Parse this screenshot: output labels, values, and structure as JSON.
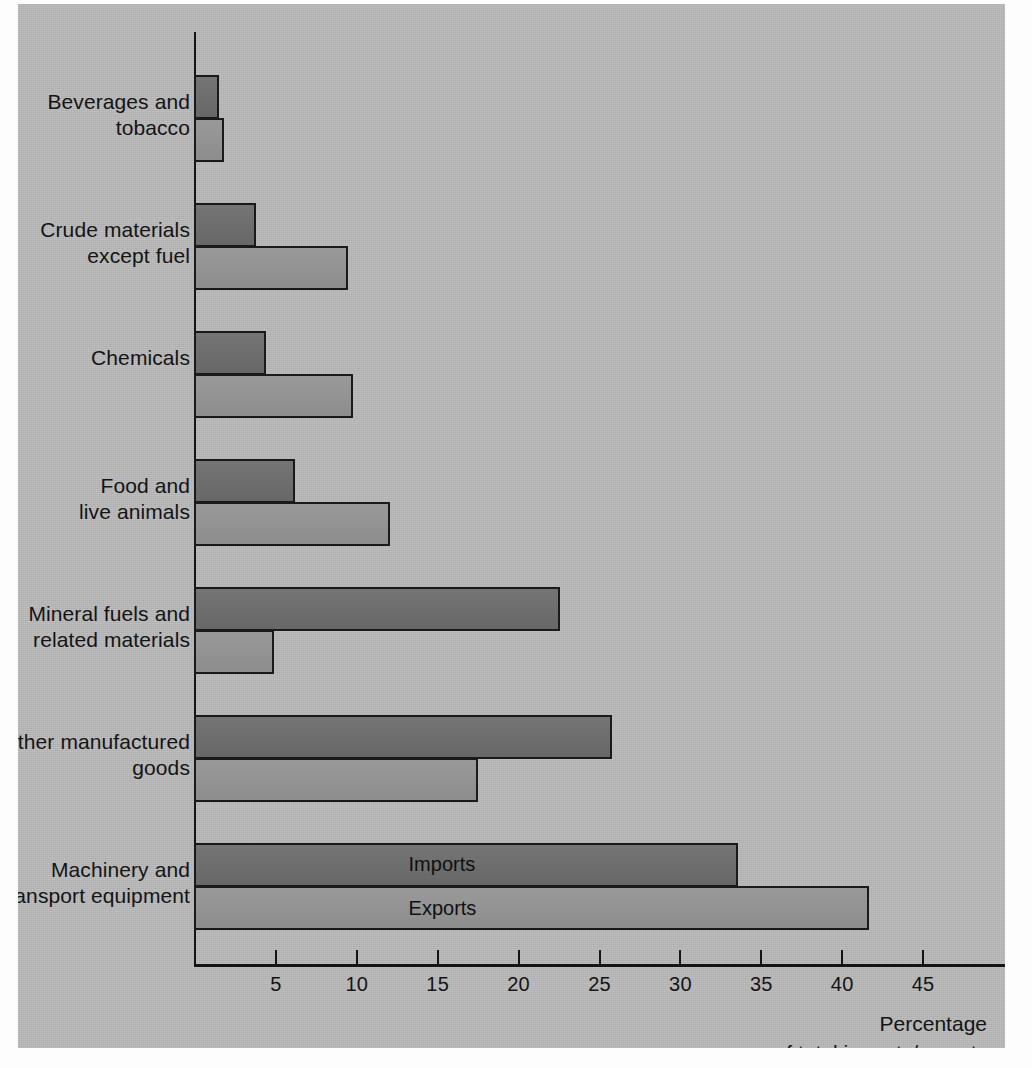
{
  "chart_data": {
    "type": "bar",
    "orientation": "horizontal",
    "title": "",
    "subtitle": "",
    "xlabel": "Percentage of total imports/exports",
    "ylabel": "",
    "xlim": [
      0,
      49
    ],
    "xticks": [
      5,
      10,
      15,
      20,
      25,
      30,
      35,
      40,
      45
    ],
    "xtick_labels": [
      "5",
      "10",
      "15",
      "20",
      "25",
      "30",
      "35",
      "40",
      "45"
    ],
    "grid": false,
    "legend_position": "in-bar",
    "categories": [
      "Beverages and\ntobacco",
      "Crude materials\nexcept fuel",
      "Chemicals",
      "Food and\nlive animals",
      "Mineral fuels and\nrelated materials",
      "Other manufactured\ngoods",
      "Machinery and\ntransport equipment"
    ],
    "series": [
      {
        "name": "Imports",
        "color": "#6d6d6d",
        "values": [
          1.4,
          3.7,
          4.3,
          6.1,
          22.5,
          25.7,
          33.5
        ]
      },
      {
        "name": "Exports",
        "color": "#949494",
        "values": [
          1.7,
          9.4,
          9.7,
          12.0,
          4.8,
          17.4,
          41.6
        ]
      }
    ],
    "annotations": [
      {
        "text": "Imports",
        "category": "Machinery and\ntransport equipment",
        "series": "Imports"
      },
      {
        "text": "Exports",
        "category": "Machinery and\ntransport equipment",
        "series": "Exports"
      }
    ],
    "caption_line1": "Percentage",
    "caption_line2": "of total imports/exports"
  },
  "axis": {
    "caption": "Percentage\nof total imports/exports",
    "tick_labels": [
      "5",
      "10",
      "15",
      "20",
      "25",
      "30",
      "35",
      "40",
      "45"
    ]
  },
  "categories": [
    {
      "label": "Beverages and\ntobacco"
    },
    {
      "label": "Crude materials\nexcept fuel"
    },
    {
      "label": "Chemicals"
    },
    {
      "label": "Food and\nlive animals"
    },
    {
      "label": "Mineral fuels and\nrelated materials"
    },
    {
      "label": "Other manufactured\ngoods"
    },
    {
      "label": "Machinery and\ntransport equipment"
    }
  ],
  "series_labels": {
    "imports": "Imports",
    "exports": "Exports"
  },
  "colors": {
    "panel_background": "#b9b9b9",
    "imports_bar": "#6d6d6d",
    "exports_bar": "#949494",
    "ink": "#151515",
    "page_background": "#fdfdfd"
  }
}
